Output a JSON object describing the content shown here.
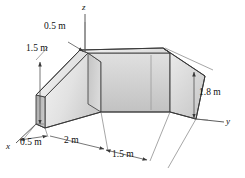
{
  "figure": {
    "type": "engineering-isometric-diagram",
    "background_color": "#ffffff",
    "line_color": "#3a3a3a",
    "body_fill_light": "#e9e9e9",
    "body_fill_mid": "#d4d4d4",
    "body_fill_dark": "#b9b9b9",
    "body_fill_inner": "#cfcfcf"
  },
  "axes": [
    {
      "id": "z",
      "label": "z",
      "x": 84,
      "y": 4
    },
    {
      "id": "y",
      "label": "y",
      "x": 228,
      "y": 120
    },
    {
      "id": "x",
      "label": "x",
      "x": 8,
      "y": 147
    }
  ],
  "dimensions": [
    {
      "id": "top-0-5",
      "label": "0.5 m",
      "x": 59,
      "y": 27
    },
    {
      "id": "left-1-5",
      "label": "1.5 m",
      "x": 41,
      "y": 49
    },
    {
      "id": "right-1-8",
      "label": "1.8 m",
      "x": 201,
      "y": 94
    },
    {
      "id": "bottom-0-5",
      "label": "0.5 m",
      "x": 22,
      "y": 145
    },
    {
      "id": "bottom-2",
      "label": "2 m",
      "x": 71,
      "y": 142
    },
    {
      "id": "bottom-1-5",
      "label": "1.5 m",
      "x": 117,
      "y": 156
    }
  ]
}
